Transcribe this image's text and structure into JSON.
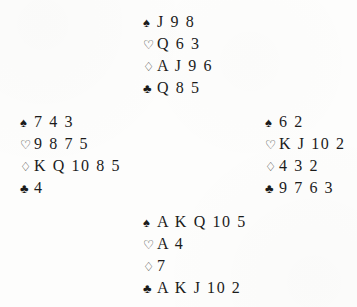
{
  "diagram": {
    "type": "bridge-deal",
    "suit_glyphs": {
      "spades": "♠",
      "hearts": "♡",
      "diamonds": "♢",
      "clubs": "♣"
    },
    "text_color": "#1b1b1b",
    "background_color": "#fdfdfc",
    "hands": {
      "north": {
        "position": "North",
        "suits": [
          {
            "suit": "spades",
            "glyph": "♠",
            "cards": "J 9 8"
          },
          {
            "suit": "hearts",
            "glyph": "♡",
            "cards": "Q 6 3"
          },
          {
            "suit": "diamonds",
            "glyph": "♢",
            "cards": "A J 9 6"
          },
          {
            "suit": "clubs",
            "glyph": "♣",
            "cards": "Q 8 5"
          }
        ]
      },
      "west": {
        "position": "West",
        "suits": [
          {
            "suit": "spades",
            "glyph": "♠",
            "cards": "7 4 3"
          },
          {
            "suit": "hearts",
            "glyph": "♡",
            "cards": "9 8 7 5"
          },
          {
            "suit": "diamonds",
            "glyph": "♢",
            "cards": "K Q 10 8 5"
          },
          {
            "suit": "clubs",
            "glyph": "♣",
            "cards": "4"
          }
        ]
      },
      "east": {
        "position": "East",
        "suits": [
          {
            "suit": "spades",
            "glyph": "♠",
            "cards": "6 2"
          },
          {
            "suit": "hearts",
            "glyph": "♡",
            "cards": "K J 10 2"
          },
          {
            "suit": "diamonds",
            "glyph": "♢",
            "cards": "4 3 2"
          },
          {
            "suit": "clubs",
            "glyph": "♣",
            "cards": "9 7 6 3"
          }
        ]
      },
      "south": {
        "position": "South",
        "suits": [
          {
            "suit": "spades",
            "glyph": "♠",
            "cards": "A K Q 10 5"
          },
          {
            "suit": "hearts",
            "glyph": "♡",
            "cards": "A 4"
          },
          {
            "suit": "diamonds",
            "glyph": "♢",
            "cards": "7"
          },
          {
            "suit": "clubs",
            "glyph": "♣",
            "cards": "A K J 10 2"
          }
        ]
      }
    }
  }
}
